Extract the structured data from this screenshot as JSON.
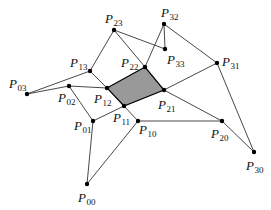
{
  "diagram": {
    "title": "",
    "colors": {
      "shaded_face": "#999999",
      "edge": "#333333",
      "point": "#000000"
    },
    "points": [
      {
        "id": "P00",
        "label": "P",
        "sub": "00",
        "x": 87,
        "y": 184,
        "lx": 78,
        "ly": 202
      },
      {
        "id": "P01",
        "label": "P",
        "sub": "01",
        "x": 93,
        "y": 121,
        "lx": 74,
        "ly": 130
      },
      {
        "id": "P02",
        "label": "P",
        "sub": "02",
        "x": 69,
        "y": 86,
        "lx": 58,
        "ly": 102
      },
      {
        "id": "P03",
        "label": "P",
        "sub": "03",
        "x": 27,
        "y": 94,
        "lx": 9,
        "ly": 88
      },
      {
        "id": "P10",
        "label": "P",
        "sub": "10",
        "x": 138,
        "y": 121,
        "lx": 139,
        "ly": 134
      },
      {
        "id": "P11",
        "label": "P",
        "sub": "11",
        "x": 124,
        "y": 106,
        "lx": 113,
        "ly": 122
      },
      {
        "id": "P12",
        "label": "P",
        "sub": "12",
        "x": 107,
        "y": 88,
        "lx": 94,
        "ly": 103
      },
      {
        "id": "P13",
        "label": "P",
        "sub": "13",
        "x": 90,
        "y": 71,
        "lx": 70,
        "ly": 67
      },
      {
        "id": "P20",
        "label": "P",
        "sub": "20",
        "x": 222,
        "y": 121,
        "lx": 211,
        "ly": 138
      },
      {
        "id": "P21",
        "label": "P",
        "sub": "21",
        "x": 164,
        "y": 90,
        "lx": 158,
        "ly": 109
      },
      {
        "id": "P22",
        "label": "P",
        "sub": "22",
        "x": 145,
        "y": 67,
        "lx": 121,
        "ly": 67
      },
      {
        "id": "P23",
        "label": "P",
        "sub": "23",
        "x": 114,
        "y": 30,
        "lx": 105,
        "ly": 23
      },
      {
        "id": "P30",
        "label": "P",
        "sub": "30",
        "x": 254,
        "y": 152,
        "lx": 246,
        "ly": 170
      },
      {
        "id": "P31",
        "label": "P",
        "sub": "31",
        "x": 217,
        "y": 63,
        "lx": 222,
        "ly": 66
      },
      {
        "id": "P32",
        "label": "P",
        "sub": "32",
        "x": 164,
        "y": 24,
        "lx": 161,
        "ly": 17
      },
      {
        "id": "P33",
        "label": "P",
        "sub": "33",
        "x": 165,
        "y": 49,
        "lx": 167,
        "ly": 64
      }
    ],
    "edges": [
      [
        "P03",
        "P13"
      ],
      [
        "P03",
        "P02"
      ],
      [
        "P02",
        "P12"
      ],
      [
        "P02",
        "P01"
      ],
      [
        "P13",
        "P23"
      ],
      [
        "P13",
        "P12"
      ],
      [
        "P23",
        "P22"
      ],
      [
        "P23",
        "P33"
      ],
      [
        "P32",
        "P33"
      ],
      [
        "P32",
        "P22"
      ],
      [
        "P32",
        "P31"
      ],
      [
        "P31",
        "P21"
      ],
      [
        "P31",
        "P30"
      ],
      [
        "P21",
        "P20"
      ],
      [
        "P11",
        "P01"
      ],
      [
        "P11",
        "P10"
      ],
      [
        "P10",
        "P20"
      ],
      [
        "P20",
        "P30"
      ],
      [
        "P01",
        "P00"
      ],
      [
        "P00",
        "P10"
      ]
    ],
    "shaded_face": [
      "P12",
      "P22",
      "P21",
      "P11"
    ]
  }
}
